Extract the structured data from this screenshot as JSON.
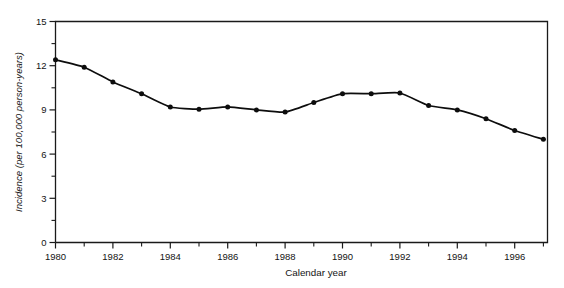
{
  "chart_data": {
    "type": "line",
    "title": "",
    "xlabel": "Calendar year",
    "ylabel": "Incidence (per 100,000 person-years)",
    "x": [
      1980,
      1981,
      1982,
      1983,
      1984,
      1985,
      1986,
      1987,
      1988,
      1989,
      1990,
      1991,
      1992,
      1993,
      1994,
      1995,
      1996,
      1997
    ],
    "values": [
      12.4,
      11.9,
      10.9,
      10.1,
      9.2,
      9.05,
      9.2,
      9.0,
      8.85,
      9.5,
      10.1,
      10.1,
      10.15,
      9.3,
      9.0,
      8.4,
      7.6,
      7.0
    ],
    "series": [
      {
        "name": "Incidence",
        "values": [
          12.4,
          11.9,
          10.9,
          10.1,
          9.2,
          9.05,
          9.2,
          9.0,
          8.85,
          9.5,
          10.1,
          10.1,
          10.15,
          9.3,
          9.0,
          8.4,
          7.6,
          7.0
        ]
      }
    ],
    "xlim": [
      1980,
      1997
    ],
    "ylim": [
      0,
      15
    ],
    "ytick_labels": [
      "0",
      "3",
      "6",
      "9",
      "12",
      "15"
    ],
    "ytick_values": [
      0,
      3,
      6,
      9,
      12,
      15
    ],
    "ytick_minor_values": [
      1.5,
      4.5,
      7.5,
      10.5,
      13.5
    ],
    "xtick_labels": [
      "1980",
      "1982",
      "1984",
      "1986",
      "1988",
      "1990",
      "1992",
      "1994",
      "1996"
    ],
    "xtick_values": [
      1980,
      1982,
      1984,
      1986,
      1988,
      1990,
      1992,
      1994,
      1996
    ],
    "xtick_minor_values": [
      1981,
      1983,
      1985,
      1987,
      1989,
      1991,
      1993,
      1995,
      1997
    ],
    "grid": false,
    "legend": "none",
    "marker": "filled-circle",
    "line_color": "#0d0d0d",
    "background_color": "#ffffff"
  }
}
